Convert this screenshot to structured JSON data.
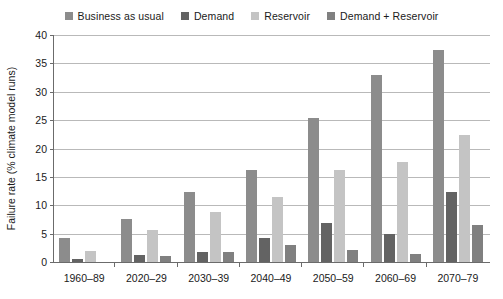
{
  "chart_data": {
    "type": "bar",
    "title": "",
    "xlabel": "",
    "ylabel": "Failure rate (% climate model runs)",
    "ylim": [
      0,
      40
    ],
    "yticks": [
      0,
      5,
      10,
      15,
      20,
      25,
      30,
      35,
      40
    ],
    "grid": true,
    "legend_position": "top",
    "categories": [
      "1960–89",
      "2020–29",
      "2030–39",
      "2040–49",
      "2050–59",
      "2060–69",
      "2070–79"
    ],
    "series": [
      {
        "name": "Business as usual",
        "color": "#8c8c8c",
        "values": [
          4.2,
          7.5,
          12.4,
          16.3,
          25.3,
          32.9,
          37.3
        ]
      },
      {
        "name": "Demand",
        "color": "#636363",
        "values": [
          0.5,
          1.2,
          1.8,
          4.2,
          6.9,
          4.9,
          12.3
        ]
      },
      {
        "name": "Reservoir",
        "color": "#c4c4c4",
        "values": [
          2.0,
          5.7,
          8.9,
          11.5,
          16.3,
          17.7,
          22.4
        ]
      },
      {
        "name": "Demand + Reservoir",
        "color": "#808080",
        "values": [
          0.0,
          1.1,
          1.7,
          3.0,
          2.1,
          1.5,
          6.6
        ]
      }
    ]
  },
  "axis": {
    "tick_labels": [
      "0",
      "5",
      "10",
      "15",
      "20",
      "25",
      "30",
      "35",
      "40"
    ]
  },
  "colors": {
    "axis": "#6b6b6b",
    "grid": "#b9b9b9",
    "text": "#1a1a1a",
    "background": "#ffffff"
  }
}
